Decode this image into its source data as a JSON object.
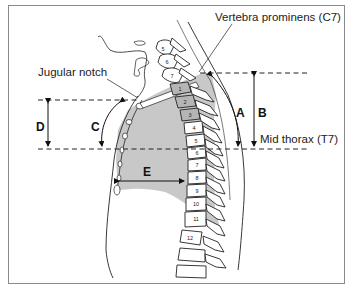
{
  "figure": {
    "labels": {
      "vertebra_prominens": "Vertebra prominens (C7)",
      "jugular_notch": "Jugular notch",
      "mid_thorax": "Mid thorax (T7)"
    },
    "measurements": {
      "A": "A",
      "B": "B",
      "C": "C",
      "D": "D",
      "E": "E"
    },
    "cervical_vertebrae": [
      "5",
      "6",
      "7"
    ],
    "thoracic_vertebrae": [
      "1",
      "2",
      "3",
      "4",
      "5",
      "6",
      "7",
      "8",
      "9",
      "10",
      "11",
      "12"
    ],
    "colors": {
      "lung_shading": "#c8c8c8",
      "line": "#222222",
      "frame": "#8a8a8a"
    }
  }
}
